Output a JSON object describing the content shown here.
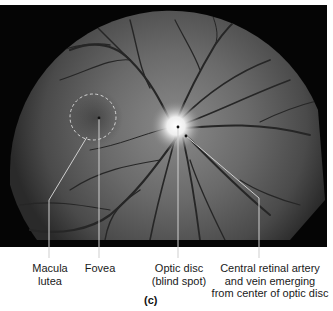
{
  "figure": {
    "caption": "(c)"
  },
  "labels": {
    "macula": {
      "line1": "Macula",
      "line2": "lutea"
    },
    "fovea": {
      "line1": "Fovea"
    },
    "optic_disc": {
      "line1": "Optic disc",
      "line2": "(blind spot)"
    },
    "artery": {
      "line1": "Central retinal artery",
      "line2": "and vein emerging",
      "line3": "from center of optic disc"
    }
  },
  "colors": {
    "background": "#ffffff",
    "frame": "#050505",
    "leader_line": "#d8d8d8",
    "text": "#1a1a1a"
  }
}
